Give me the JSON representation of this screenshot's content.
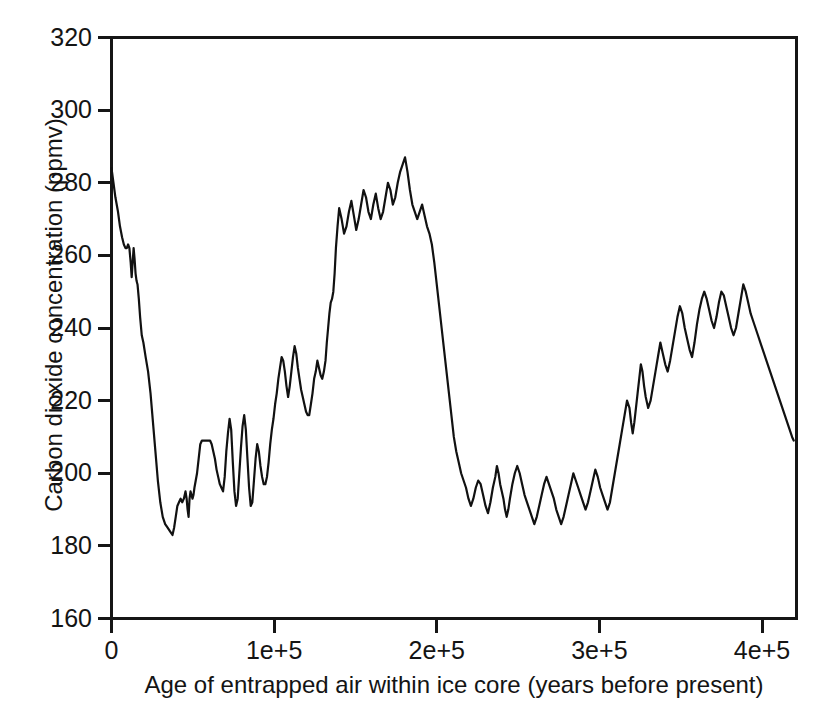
{
  "chart_data": {
    "type": "line",
    "title": "",
    "xlabel": "Age of entrapped air within ice core (years before present)",
    "ylabel": "Carbon dioxide concentration (ppmv)",
    "xlim": [
      0,
      420000
    ],
    "ylim": [
      160,
      320
    ],
    "grid": false,
    "legend": null,
    "x_ticks": [
      {
        "value": 0,
        "label": "0"
      },
      {
        "value": 100000,
        "label": "1e+5"
      },
      {
        "value": 200000,
        "label": "2e+5"
      },
      {
        "value": 300000,
        "label": "3e+5"
      },
      {
        "value": 400000,
        "label": "4e+5"
      }
    ],
    "y_ticks": [
      {
        "value": 320,
        "label": "320"
      },
      {
        "value": 300,
        "label": "300"
      },
      {
        "value": 280,
        "label": "280"
      },
      {
        "value": 260,
        "label": "260"
      },
      {
        "value": 240,
        "label": "240"
      },
      {
        "value": 220,
        "label": "220"
      },
      {
        "value": 200,
        "label": "200"
      },
      {
        "value": 180,
        "label": "180"
      },
      {
        "value": 160,
        "label": "160"
      }
    ],
    "series": [
      {
        "name": "Vostok ice core CO2",
        "color": "#111111",
        "x": [
          0,
          1200,
          2400,
          4000,
          5200,
          6500,
          7600,
          8600,
          9400,
          10200,
          11000,
          11800,
          12400,
          13000,
          13600,
          14200,
          14800,
          15400,
          16000,
          16800,
          17600,
          18600,
          19600,
          21000,
          22500,
          24000,
          25500,
          27000,
          28500,
          30000,
          31500,
          33000,
          34500,
          36000,
          37500,
          38500,
          39500,
          40500,
          41500,
          42500,
          43500,
          44500,
          45500,
          46200,
          46800,
          47400,
          48000,
          48600,
          49200,
          49800,
          50400,
          51000,
          51800,
          52600,
          53600,
          54600,
          55600,
          56600,
          57600,
          58600,
          59600,
          60600,
          61600,
          62600,
          63600,
          64600,
          65600,
          66600,
          67600,
          68600,
          69600,
          70600,
          71600,
          72600,
          73600,
          74600,
          75600,
          76600,
          77600,
          78600,
          79600,
          80600,
          81600,
          82600,
          83600,
          84600,
          85600,
          86600,
          87600,
          88600,
          89600,
          90600,
          91600,
          92600,
          93600,
          94600,
          95600,
          96600,
          97600,
          98600,
          99600,
          100600,
          101600,
          102600,
          103600,
          104600,
          105600,
          106600,
          107600,
          108600,
          109600,
          110600,
          111600,
          112600,
          113600,
          114600,
          115600,
          116600,
          117600,
          118600,
          119600,
          120600,
          121600,
          122600,
          123600,
          124600,
          125600,
          126600,
          127600,
          128600,
          129600,
          130600,
          131600,
          132400,
          133200,
          134000,
          134800,
          135600,
          136400,
          137200,
          138000,
          139000,
          140000,
          141500,
          143000,
          144500,
          146000,
          147500,
          149000,
          150500,
          152000,
          153500,
          155000,
          156500,
          158000,
          159500,
          161000,
          162500,
          164000,
          165500,
          167000,
          168500,
          170000,
          171500,
          173000,
          174500,
          176000,
          177500,
          179000,
          180500,
          182000,
          183500,
          185000,
          186500,
          188000,
          189500,
          191000,
          192500,
          194000,
          195500,
          197000,
          198500,
          200000,
          201500,
          203000,
          204500,
          206000,
          207500,
          209000,
          210500,
          212000,
          213500,
          215000,
          216500,
          218000,
          219500,
          221000,
          222500,
          224000,
          225500,
          227000,
          228500,
          230000,
          231500,
          233000,
          234500,
          236000,
          237000,
          238000,
          239000,
          240000,
          241000,
          242000,
          243000,
          244000,
          245000,
          246500,
          248000,
          249500,
          251000,
          252500,
          254000,
          255500,
          257000,
          258500,
          260000,
          261500,
          263000,
          264500,
          266000,
          267500,
          269000,
          270500,
          272000,
          273500,
          275000,
          276500,
          278000,
          279500,
          281000,
          282500,
          284000,
          285500,
          287000,
          288500,
          290000,
          291500,
          293000,
          294500,
          296000,
          297500,
          299000,
          300500,
          302000,
          303500,
          305000,
          306500,
          308000,
          309500,
          311000,
          312500,
          314000,
          315500,
          317000,
          318500,
          319500,
          320500,
          321500,
          322500,
          323500,
          324500,
          325500,
          326500,
          327500,
          328500,
          330000,
          331500,
          333000,
          334500,
          336000,
          337500,
          339000,
          340500,
          342000,
          343500,
          345000,
          346500,
          348000,
          349500,
          351000,
          352500,
          354000,
          355500,
          357000,
          358500,
          360000,
          361500,
          363000,
          364500,
          366000,
          367500,
          369000,
          370500,
          372000,
          373500,
          375000,
          376500,
          378000,
          379500,
          381000,
          382500,
          384000,
          385500,
          387000,
          388500,
          390000,
          391500,
          393000,
          394500,
          396000,
          397500,
          399000,
          400500,
          402000,
          403500,
          405000,
          406500,
          408000,
          409500,
          411000,
          412500,
          414000,
          415500,
          417000,
          418500,
          419500
        ],
        "y": [
          284,
          280,
          276,
          272,
          268,
          265,
          263,
          262,
          262,
          263,
          262,
          258,
          254,
          258,
          262,
          259,
          255,
          253,
          252,
          248,
          243,
          238,
          236,
          232,
          228,
          222,
          214,
          206,
          198,
          192,
          188,
          186,
          185,
          184,
          183,
          185,
          188,
          191,
          192,
          193,
          192,
          193,
          195,
          193,
          190,
          188,
          193,
          195,
          194,
          193,
          194,
          196,
          198,
          200,
          204,
          208,
          209,
          209,
          209,
          209,
          209,
          209,
          208,
          206,
          204,
          201,
          199,
          197,
          196,
          195,
          199,
          206,
          211,
          215,
          212,
          203,
          195,
          191,
          193,
          200,
          207,
          213,
          216,
          212,
          204,
          196,
          191,
          192,
          198,
          204,
          208,
          206,
          202,
          199,
          197,
          197,
          199,
          203,
          208,
          212,
          215,
          219,
          222,
          226,
          229,
          232,
          231,
          228,
          224,
          221,
          224,
          228,
          232,
          235,
          233,
          229,
          226,
          223,
          221,
          219,
          217,
          216,
          216,
          219,
          222,
          226,
          228,
          231,
          229,
          227,
          226,
          228,
          231,
          236,
          240,
          244,
          247,
          248,
          250,
          255,
          262,
          268,
          273,
          270,
          266,
          268,
          272,
          275,
          271,
          267,
          270,
          274,
          278,
          276,
          272,
          270,
          274,
          277,
          273,
          270,
          272,
          276,
          280,
          278,
          274,
          276,
          280,
          283,
          285,
          287,
          283,
          278,
          274,
          272,
          270,
          272,
          274,
          271,
          268,
          266,
          263,
          258,
          252,
          246,
          240,
          234,
          228,
          222,
          216,
          210,
          206,
          203,
          200,
          198,
          196,
          193,
          191,
          193,
          196,
          198,
          197,
          194,
          191,
          189,
          192,
          196,
          199,
          202,
          200,
          197,
          195,
          193,
          190,
          188,
          190,
          193,
          197,
          200,
          202,
          200,
          197,
          194,
          192,
          190,
          188,
          186,
          188,
          191,
          194,
          197,
          199,
          197,
          195,
          193,
          190,
          188,
          186,
          188,
          191,
          194,
          197,
          200,
          198,
          196,
          194,
          192,
          190,
          192,
          195,
          198,
          201,
          199,
          196,
          194,
          192,
          190,
          192,
          196,
          200,
          204,
          208,
          212,
          216,
          220,
          218,
          214,
          211,
          214,
          218,
          222,
          226,
          230,
          228,
          224,
          221,
          218,
          220,
          224,
          228,
          232,
          236,
          233,
          230,
          228,
          231,
          235,
          239,
          243,
          246,
          244,
          240,
          237,
          234,
          232,
          236,
          241,
          245,
          248,
          250,
          248,
          245,
          242,
          240,
          243,
          247,
          250,
          249,
          246,
          243,
          240,
          238,
          240,
          244,
          248,
          252,
          250,
          247,
          244,
          242,
          240,
          238,
          236,
          234,
          232,
          230,
          228,
          226,
          224,
          222,
          220,
          218,
          216,
          214,
          212,
          210,
          209
        ],
        "note": "Values read from the plotted curve; sawtooth glacial-interglacial cycles between ~182 and ~299 ppmv"
      }
    ],
    "extrema": {
      "max_value": 299,
      "max_at": 318000,
      "min_value": 182,
      "min_at": 18600,
      "modern_value": 284,
      "modern_at": 0
    }
  }
}
